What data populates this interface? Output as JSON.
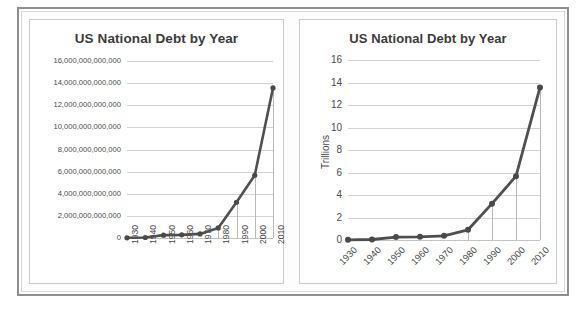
{
  "charts": [
    {
      "id": "left",
      "title": "US National Debt by Year",
      "y_axis_title": "",
      "ylabel_rotation": 0,
      "xlabel_rotation": 90,
      "yticks": [
        "0",
        "2,000,000,000,000",
        "4,000,000,000,000",
        "6,000,000,000,000",
        "8,000,000,000,000",
        "10,000,000,000,000",
        "12,000,000,000,000",
        "14,000,000,000,000",
        "16,000,000,000,000"
      ],
      "xticks": [
        "1930",
        "1940",
        "1950",
        "1960",
        "1970",
        "1980",
        "1990",
        "2000",
        "2010"
      ]
    },
    {
      "id": "right",
      "title": "US National Debt by Year",
      "y_axis_title": "Trillions",
      "ylabel_rotation": 0,
      "xlabel_rotation": 45,
      "yticks": [
        "0",
        "2",
        "4",
        "6",
        "8",
        "10",
        "12",
        "14",
        "16"
      ],
      "xticks": [
        "1930",
        "1940",
        "1950",
        "1960",
        "1970",
        "1980",
        "1990",
        "2000",
        "2010"
      ]
    }
  ],
  "chart_data": [
    {
      "type": "line",
      "title": "US National Debt by Year",
      "xlabel": "",
      "ylabel": "",
      "categories": [
        "1930",
        "1940",
        "1950",
        "1960",
        "1970",
        "1980",
        "1990",
        "2000",
        "2010"
      ],
      "values": [
        16000000000,
        43000000000,
        257000000000,
        286000000000,
        371000000000,
        908000000000,
        3233000000000,
        5674000000000,
        13562000000000
      ],
      "ylim": [
        0,
        16000000000000
      ],
      "ytick_values": [
        0,
        2000000000000,
        4000000000000,
        6000000000000,
        8000000000000,
        10000000000000,
        12000000000000,
        14000000000000,
        16000000000000
      ],
      "ytick_labels": [
        "0",
        "2,000,000,000,000",
        "4,000,000,000,000",
        "6,000,000,000,000",
        "8,000,000,000,000",
        "10,000,000,000,000",
        "12,000,000,000,000",
        "14,000,000,000,000",
        "16,000,000,000,000"
      ],
      "grid": true,
      "legend": false,
      "markers": true,
      "droplines_at": [
        "1980",
        "1990",
        "2000",
        "2010"
      ],
      "line_color": "#4f4f4f",
      "gridline_color": "#d2d3d5"
    },
    {
      "type": "line",
      "title": "US National Debt by Year",
      "xlabel": "",
      "ylabel": "Trillions",
      "categories": [
        "1930",
        "1940",
        "1950",
        "1960",
        "1970",
        "1980",
        "1990",
        "2000",
        "2010"
      ],
      "values": [
        0.016,
        0.043,
        0.257,
        0.286,
        0.371,
        0.908,
        3.233,
        5.674,
        13.562
      ],
      "ylim": [
        0,
        16
      ],
      "ytick_values": [
        0,
        2,
        4,
        6,
        8,
        10,
        12,
        14,
        16
      ],
      "ytick_labels": [
        "0",
        "2",
        "4",
        "6",
        "8",
        "10",
        "12",
        "14",
        "16"
      ],
      "grid": true,
      "legend": false,
      "markers": true,
      "droplines_at": [
        "1980",
        "1990",
        "2000",
        "2010"
      ],
      "line_color": "#4f4f4f",
      "gridline_color": "#d2d3d5"
    }
  ]
}
